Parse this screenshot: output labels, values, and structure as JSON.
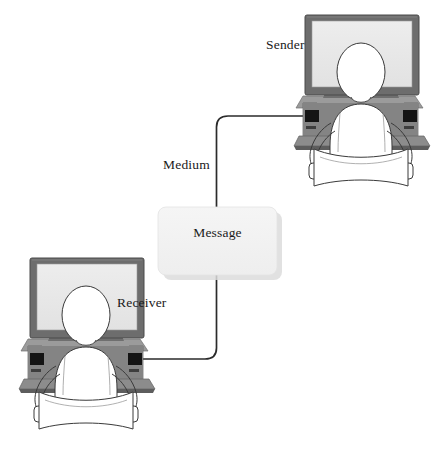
{
  "diagram": {
    "type": "process-flow",
    "background_color": "#ffffff",
    "nodes": [
      {
        "id": "sender",
        "label": "Sender",
        "kind": "person-at-computer",
        "position": {
          "x": 355,
          "y": 90
        },
        "label_position": {
          "x": 266,
          "y": 37
        }
      },
      {
        "id": "message",
        "label": "Message",
        "kind": "rounded-box",
        "position": {
          "x": 217,
          "y": 241
        },
        "box": {
          "x": 158,
          "y": 207,
          "width": 119,
          "height": 68
        },
        "fill_color": "#f2f2f2",
        "shadow_color": "#d8d8d8"
      },
      {
        "id": "receiver",
        "label": "Receiver",
        "kind": "person-at-computer",
        "position": {
          "x": 80,
          "y": 340
        },
        "label_position": {
          "x": 117,
          "y": 295
        }
      }
    ],
    "edges": [
      {
        "id": "medium-upper",
        "label": "Medium",
        "from": "message",
        "to": "sender",
        "label_position": {
          "x": 163,
          "y": 157
        },
        "stroke_color": "#2b2b2b",
        "stroke_width": 1.6
      },
      {
        "id": "medium-lower",
        "label": "",
        "from": "message",
        "to": "receiver",
        "stroke_color": "#2b2b2b",
        "stroke_width": 1.6
      }
    ],
    "labels": {
      "sender": "Sender",
      "receiver": "Receiver",
      "medium": "Medium",
      "message": "Message"
    },
    "colors": {
      "line": "#2b2b2b",
      "monitor_bezel": "#6d6d6d",
      "monitor_bezel_dark": "#4f4f4f",
      "monitor_screen": "#e9e9e9",
      "desk_top": "#8e8e8e",
      "desk_front": "#696969",
      "desk_shadow": "#545454",
      "drive_slot": "#141414",
      "body_fill": "#ffffff",
      "body_outline": "#3a3a3a",
      "text": "#1a1a1a",
      "box_fill": "#f2f2f2",
      "box_shadow": "#d9d9d9"
    }
  }
}
